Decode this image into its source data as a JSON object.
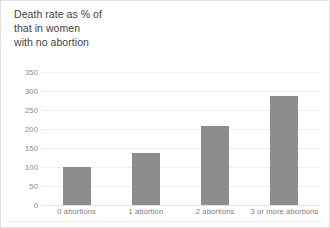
{
  "chart_data": {
    "type": "bar",
    "title": "Death rate as % of\nthat in women\nwith no abortion",
    "xlabel": "",
    "ylabel": "",
    "categories": [
      "0 abortions",
      "1 abortion",
      "2 abortions",
      "3 or more abortions"
    ],
    "values": [
      100,
      138,
      207,
      287
    ],
    "ylim": [
      0,
      350
    ],
    "yticks": [
      0,
      50,
      100,
      150,
      200,
      250,
      300,
      350
    ],
    "ytick_labels": [
      "0",
      "50",
      "100",
      "150",
      "200",
      "250",
      "300",
      "350"
    ],
    "grid": "horizontal",
    "legend": "none",
    "series": [
      {
        "name": "Death rate as % of that in women with no abortion",
        "values": [
          100,
          138,
          207,
          287
        ],
        "color": "#8d8d8d"
      }
    ],
    "colors": {
      "bar": "#8d8d8d",
      "gridline": "#efefef",
      "axis": "#e4e4e4",
      "tick_label": "#8a8a8a",
      "title_text": "#3f3f3f",
      "background": "#ffffff",
      "border": "#e2e2e2"
    }
  }
}
